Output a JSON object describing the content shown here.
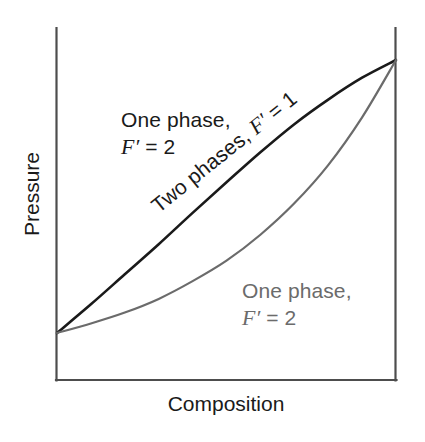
{
  "figure": {
    "background_color": "#ffffff",
    "width": 425,
    "height": 442
  },
  "axes": {
    "y_label": "Pressure",
    "x_label": "Composition",
    "frame_color": "#4d4d4d",
    "left_px": 56,
    "right_px": 396,
    "top_px": 28,
    "bottom_px": 380,
    "ticks_shown": false,
    "tick_labels": []
  },
  "annotations": {
    "upper_region": {
      "line1": "One phase,",
      "line2_variable": "F′",
      "line2_rest": " = 2",
      "color": "#1a1a1a",
      "rotation_deg": 0
    },
    "lower_region": {
      "line1": "One phase,",
      "line2_variable": "F′",
      "line2_rest": " = 2",
      "color": "#6b6b6b",
      "rotation_deg": 0
    },
    "two_phase_region": {
      "text_prefix": "Two phases, ",
      "variable": "F′",
      "text_suffix": " = 1",
      "color": "#1a1a1a",
      "rotation_deg": -38.8
    }
  },
  "chart_data": {
    "type": "line",
    "title": "",
    "xlabel": "Composition",
    "ylabel": "Pressure",
    "xlim": [
      0,
      1
    ],
    "ylim": [
      0,
      1
    ],
    "grid": false,
    "legend": "none",
    "axis_tick_labels": {
      "x": [],
      "y": []
    },
    "series": [
      {
        "name": "Bubble-point line (upper boundary, liquid composition)",
        "color": "#1a1a1a",
        "stroke_width": 2.6,
        "x": [
          0.0,
          0.1,
          0.2,
          0.3,
          0.4,
          0.5,
          0.6,
          0.7,
          0.8,
          0.9,
          1.0
        ],
        "y": [
          0.0,
          0.105,
          0.215,
          0.325,
          0.44,
          0.552,
          0.662,
          0.765,
          0.855,
          0.935,
          1.0
        ]
      },
      {
        "name": "Dew-point line (lower boundary, vapour composition)",
        "color": "#6b6b6b",
        "stroke_width": 2.2,
        "x": [
          0.0,
          0.1,
          0.2,
          0.3,
          0.4,
          0.5,
          0.6,
          0.7,
          0.8,
          0.9,
          1.0
        ],
        "y": [
          0.0,
          0.035,
          0.075,
          0.125,
          0.19,
          0.265,
          0.36,
          0.475,
          0.615,
          0.79,
          1.0
        ]
      }
    ],
    "regions": [
      {
        "name": "one-phase-upper",
        "label": "One phase, F′ = 2",
        "position": "above bubble line"
      },
      {
        "name": "two-phase",
        "label": "Two phases, F′ = 1",
        "position": "between the two lines"
      },
      {
        "name": "one-phase-lower",
        "label": "One phase, F′ = 2",
        "position": "below dew line"
      }
    ],
    "convergence_points": [
      {
        "x": 0.0,
        "y": 0.0,
        "note": "both curves meet on left axis"
      },
      {
        "x": 1.0,
        "y": 1.0,
        "note": "both curves meet on right axis"
      }
    ]
  }
}
